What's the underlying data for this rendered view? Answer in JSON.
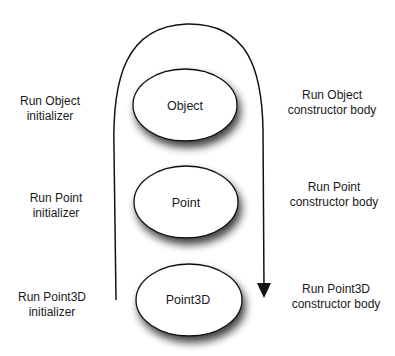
{
  "diagram": {
    "nodes": [
      {
        "id": "object",
        "label": "Object"
      },
      {
        "id": "point",
        "label": "Point"
      },
      {
        "id": "point3d",
        "label": "Point3D"
      }
    ],
    "left_labels": [
      {
        "line1": "Run Object",
        "line2": "initializer"
      },
      {
        "line1": "Run Point",
        "line2": "initializer"
      },
      {
        "line1": "Run Point3D",
        "line2": "initializer"
      }
    ],
    "right_labels": [
      {
        "line1": "Run Object",
        "line2": "constructor body"
      },
      {
        "line1": "Run Point",
        "line2": "constructor body"
      },
      {
        "line1": "Run Point3D",
        "line2": "constructor body"
      }
    ],
    "flow_arrow": {
      "direction": "up-left-side, over-top, down-right-side"
    },
    "colors": {
      "stroke": "#111111",
      "fill": "#ffffff",
      "shadow": "#555555"
    }
  }
}
